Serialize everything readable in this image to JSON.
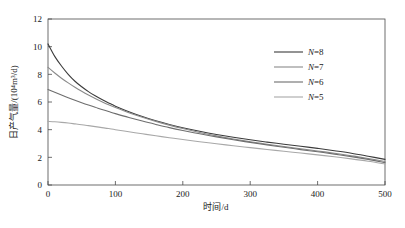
{
  "chart_data": {
    "type": "line",
    "title": "",
    "xlabel": "时间/d",
    "ylabel": "日产气量/(10⁴m³/d)",
    "xlim": [
      0,
      500
    ],
    "ylim": [
      0,
      12
    ],
    "xticks": [
      "0",
      "100",
      "200",
      "300",
      "400",
      "500"
    ],
    "yticks": [
      "0",
      "2",
      "4",
      "6",
      "8",
      "10",
      "12"
    ],
    "xtick_values": [
      0,
      100,
      200,
      300,
      400,
      500
    ],
    "ytick_values": [
      0,
      2,
      4,
      6,
      8,
      10,
      12
    ],
    "grid": false,
    "legend_position": "upper-right",
    "x": [
      0,
      10,
      20,
      30,
      40,
      50,
      60,
      70,
      80,
      90,
      100,
      120,
      140,
      160,
      180,
      200,
      225,
      250,
      275,
      300,
      325,
      350,
      375,
      400,
      425,
      450,
      475,
      500
    ],
    "series": [
      {
        "name": "N=8",
        "label_prefix": "N",
        "label_value": "8",
        "color": "#3b3b3b",
        "values": [
          10.2,
          9.3,
          8.6,
          8.0,
          7.5,
          7.1,
          6.75,
          6.45,
          6.18,
          5.93,
          5.7,
          5.3,
          4.95,
          4.65,
          4.38,
          4.14,
          3.88,
          3.65,
          3.45,
          3.27,
          3.1,
          2.95,
          2.8,
          2.65,
          2.48,
          2.3,
          2.08,
          1.85
        ]
      },
      {
        "name": "N=7",
        "label_prefix": "N",
        "label_value": "7",
        "color": "#8a8a8a",
        "values": [
          8.5,
          8.1,
          7.72,
          7.38,
          7.06,
          6.77,
          6.5,
          6.25,
          6.02,
          5.8,
          5.6,
          5.23,
          4.9,
          4.6,
          4.33,
          4.08,
          3.8,
          3.55,
          3.33,
          3.13,
          2.95,
          2.78,
          2.62,
          2.46,
          2.3,
          2.12,
          1.92,
          1.7
        ]
      },
      {
        "name": "N=6",
        "label_prefix": "N",
        "label_value": "6",
        "color": "#6e6e6e",
        "values": [
          6.9,
          6.7,
          6.5,
          6.31,
          6.13,
          5.95,
          5.78,
          5.62,
          5.46,
          5.31,
          5.16,
          4.88,
          4.62,
          4.38,
          4.15,
          3.94,
          3.7,
          3.48,
          3.27,
          3.08,
          2.9,
          2.73,
          2.56,
          2.4,
          2.23,
          2.05,
          1.85,
          1.62
        ]
      },
      {
        "name": "N=5",
        "label_prefix": "N",
        "label_value": "5",
        "color": "#a8a8a8",
        "values": [
          4.6,
          4.57,
          4.53,
          4.48,
          4.42,
          4.36,
          4.29,
          4.22,
          4.15,
          4.08,
          4.0,
          3.85,
          3.7,
          3.56,
          3.42,
          3.29,
          3.13,
          2.98,
          2.84,
          2.7,
          2.57,
          2.44,
          2.31,
          2.18,
          2.04,
          1.89,
          1.72,
          1.52
        ]
      }
    ]
  },
  "figure": {
    "background": "#ffffff",
    "axis_color": "#4a4a4a"
  }
}
